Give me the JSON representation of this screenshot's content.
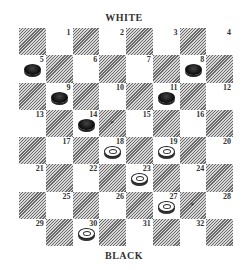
{
  "labels": {
    "top": "WHITE",
    "bottom": "BLACK"
  },
  "board": {
    "rows": 8,
    "cols": 8,
    "squares": [
      {
        "n": "1",
        "r": 0,
        "c": 1
      },
      {
        "n": "2",
        "r": 0,
        "c": 3
      },
      {
        "n": "3",
        "r": 0,
        "c": 5
      },
      {
        "n": "4",
        "r": 0,
        "c": 7
      },
      {
        "n": "5",
        "r": 1,
        "c": 0
      },
      {
        "n": "6",
        "r": 1,
        "c": 2
      },
      {
        "n": "7",
        "r": 1,
        "c": 4
      },
      {
        "n": "8",
        "r": 1,
        "c": 6
      },
      {
        "n": "9",
        "r": 2,
        "c": 1
      },
      {
        "n": "10",
        "r": 2,
        "c": 3
      },
      {
        "n": "11",
        "r": 2,
        "c": 5
      },
      {
        "n": "12",
        "r": 2,
        "c": 7
      },
      {
        "n": "13",
        "r": 3,
        "c": 0
      },
      {
        "n": "14",
        "r": 3,
        "c": 2
      },
      {
        "n": "15",
        "r": 3,
        "c": 4
      },
      {
        "n": "16",
        "r": 3,
        "c": 6
      },
      {
        "n": "17",
        "r": 4,
        "c": 1
      },
      {
        "n": "18",
        "r": 4,
        "c": 3
      },
      {
        "n": "19",
        "r": 4,
        "c": 5
      },
      {
        "n": "20",
        "r": 4,
        "c": 7
      },
      {
        "n": "21",
        "r": 5,
        "c": 0
      },
      {
        "n": "22",
        "r": 5,
        "c": 2
      },
      {
        "n": "23",
        "r": 5,
        "c": 4
      },
      {
        "n": "24",
        "r": 5,
        "c": 6
      },
      {
        "n": "25",
        "r": 6,
        "c": 1
      },
      {
        "n": "26",
        "r": 6,
        "c": 3
      },
      {
        "n": "27",
        "r": 6,
        "c": 5
      },
      {
        "n": "28",
        "r": 6,
        "c": 7
      },
      {
        "n": "29",
        "r": 7,
        "c": 0
      },
      {
        "n": "30",
        "r": 7,
        "c": 2
      },
      {
        "n": "31",
        "r": 7,
        "c": 4
      },
      {
        "n": "32",
        "r": 7,
        "c": 6
      }
    ],
    "black_pieces": [
      "5",
      "8",
      "9",
      "11",
      "14"
    ],
    "white_pieces": [
      "18",
      "19",
      "23",
      "27",
      "30"
    ],
    "marks": [
      {
        "r": 3,
        "c": 3,
        "symbol": "*"
      },
      {
        "r": 6,
        "c": 6,
        "symbol": "*"
      }
    ]
  }
}
